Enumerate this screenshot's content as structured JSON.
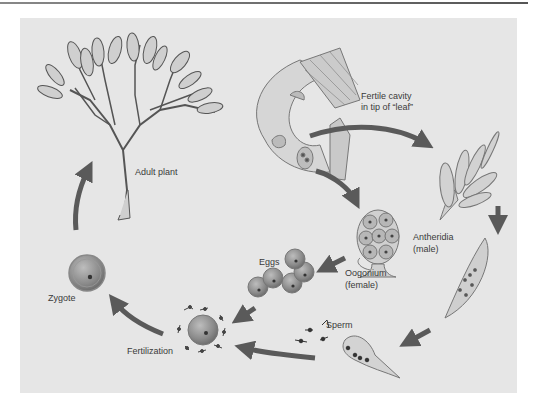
{
  "diagram": {
    "type": "life-cycle",
    "colors": {
      "panel_background": "#e6e6e6",
      "arrow": "#5a5a5a",
      "label_text": "#3a3a3a",
      "cell": "#8a8a8a"
    },
    "labels": {
      "adult_plant": "Adult plant",
      "fertile_cavity_line1": "Fertile cavity",
      "fertile_cavity_line2": "in tip of “leaf”",
      "antheridia_line1": "Antheridia",
      "antheridia_line2": "(male)",
      "oogonium_line1": "Oogonium",
      "oogonium_line2": "(female)",
      "eggs": "Eggs",
      "sperm": "Sperm",
      "fertilization": "Fertilization",
      "zygote": "Zygote"
    },
    "stages": [
      "Adult plant",
      "Fertile cavity in tip of “leaf”",
      "Antheridia (male)",
      "Oogonium (female)",
      "Eggs",
      "Sperm",
      "Fertilization",
      "Zygote"
    ],
    "flow": [
      [
        "Fertile cavity in tip of “leaf”",
        "Antheridia (male)"
      ],
      [
        "Fertile cavity in tip of “leaf”",
        "Oogonium (female)"
      ],
      [
        "Antheridia (male)",
        "Sperm"
      ],
      [
        "Oogonium (female)",
        "Eggs"
      ],
      [
        "Eggs",
        "Fertilization"
      ],
      [
        "Sperm",
        "Fertilization"
      ],
      [
        "Fertilization",
        "Zygote"
      ],
      [
        "Zygote",
        "Adult plant"
      ]
    ]
  }
}
